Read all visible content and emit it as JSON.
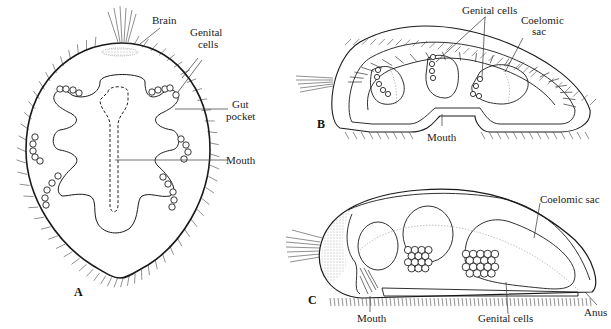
{
  "figure": {
    "panels": [
      {
        "id": "A",
        "label": "A",
        "labels": {
          "brain": "Brain",
          "genital_cells_1": "Genital",
          "genital_cells_2": "cells",
          "gut_pocket_1": "Gut",
          "gut_pocket_2": "pocket",
          "mouth": "Mouth"
        }
      },
      {
        "id": "B",
        "label": "B",
        "labels": {
          "genital_cells": "Genital cells",
          "coelomic_sac_1": "Coelomic",
          "coelomic_sac_2": "sac",
          "mouth": "Mouth"
        }
      },
      {
        "id": "C",
        "label": "C",
        "labels": {
          "coelomic_sac": "Coelomic sac",
          "mouth": "Mouth",
          "genital_cells": "Genital cells",
          "anus": "Anus"
        }
      }
    ]
  }
}
